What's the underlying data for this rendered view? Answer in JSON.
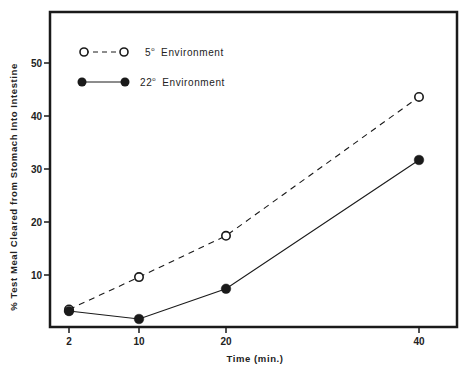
{
  "chart_data": {
    "type": "line",
    "title": "",
    "xlabel": "Time (min.)",
    "ylabel": "% Test Meal Cleared from Stomach Into Intestine",
    "x": [
      2,
      10,
      20,
      40
    ],
    "x_tick_labels": [
      "2",
      "10",
      "20",
      "40"
    ],
    "y_ticks": [
      10,
      20,
      30,
      40,
      50
    ],
    "y_tick_labels": [
      "10",
      "20",
      "30",
      "40",
      "50"
    ],
    "ylim": [
      0,
      59
    ],
    "xlim": [
      0,
      44
    ],
    "grid": false,
    "legend_position": "top-left",
    "series": [
      {
        "name": "5° Environment",
        "legend_label": "5",
        "legend_suffix": "Environment",
        "marker": "open-circle",
        "line_style": "dashed",
        "values": [
          3.5,
          9.6,
          17.4,
          43.6
        ]
      },
      {
        "name": "22° Environment",
        "legend_label": "22",
        "legend_suffix": "Environment",
        "marker": "filled-circle",
        "line_style": "solid",
        "values": [
          3.2,
          1.7,
          7.4,
          31.7
        ]
      }
    ],
    "colors": {
      "ink": "#1a1a1a",
      "background": "#ffffff"
    }
  }
}
